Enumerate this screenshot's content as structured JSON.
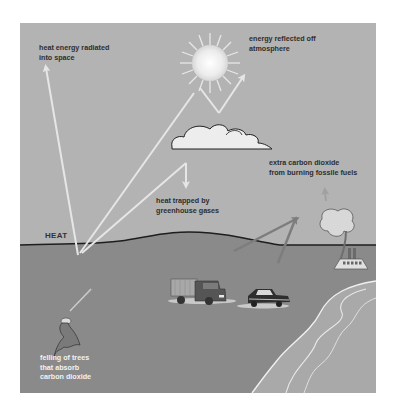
{
  "diagram": {
    "type": "greenhouse-effect-illustration",
    "labels": {
      "heat_radiated": "heat energy radiated\ninto space",
      "energy_reflected": "energy reflected off\natmosphere",
      "heat_trapped": "heat trapped by\ngreenhouse gases",
      "extra_co2": "extra carbon dioxide\nfrom burning fossile fuels",
      "heat": "HEAT",
      "felling_trees": "felling of trees\nthat absorb\ncarbon dioxide"
    },
    "elements": [
      "sun",
      "cloud",
      "truck",
      "car",
      "factory-ship",
      "felled-tree",
      "shoreline",
      "arrows"
    ],
    "colors": {
      "sky": "#b3b3b3",
      "ground": "#8a8a8a",
      "sea": "#a9a9a9",
      "arrow": "#e6e6e6",
      "emission_arrow": "#7d7d7d",
      "horizon_line": "#1e1e1e"
    }
  }
}
